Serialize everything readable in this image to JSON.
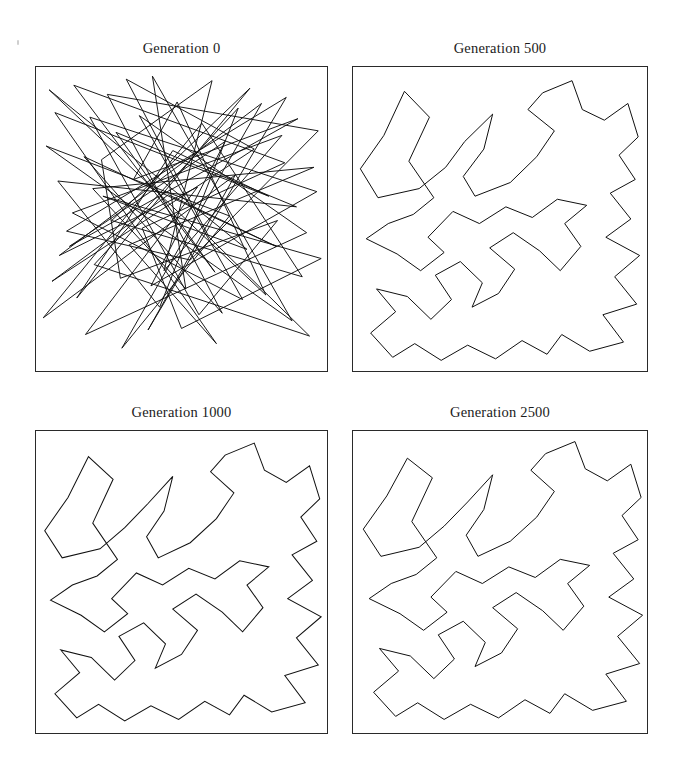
{
  "figure": {
    "kind": "tsp-evolution-grid",
    "rows": 2,
    "cols": 2,
    "background": "#ffffff",
    "line_color": "#101010",
    "frame_color": "#2a2a2a"
  },
  "panels": [
    {
      "title": "Generation 0",
      "index": 0,
      "generation": 0,
      "frame": {
        "x": 35,
        "y": 66,
        "w": 293,
        "h": 306
      }
    },
    {
      "title": "Generation 500",
      "index": 1,
      "generation": 500,
      "frame": {
        "x": 352,
        "y": 66,
        "w": 296,
        "h": 306
      }
    },
    {
      "title": "Generation 1000",
      "index": 2,
      "generation": 1000,
      "frame": {
        "x": 35,
        "y": 430,
        "w": 293,
        "h": 304
      }
    },
    {
      "title": "Generation 2500",
      "index": 3,
      "generation": 2500,
      "frame": {
        "x": 352,
        "y": 430,
        "w": 296,
        "h": 304
      }
    }
  ],
  "chart_data": {
    "type": "line",
    "subtitle": "Closed tour through a fixed set of cities, drawn at four generations",
    "xlabel": "",
    "ylabel": "",
    "xlim": [
      0,
      100
    ],
    "ylim": [
      0,
      100
    ],
    "grid": false,
    "legend": false,
    "axis_ticks": false,
    "panel_titles": [
      "Generation 0",
      "Generation 500",
      "Generation 1000",
      "Generation 2500"
    ],
    "series": [
      {
        "name": "Generation 0",
        "closed": true,
        "n_points": 74,
        "description": "Random initial tour, heavily self-crossing",
        "points": [
          [
            22.5,
            69.5
          ],
          [
            60.5,
            95.5
          ],
          [
            44.0,
            33.0
          ],
          [
            84.5,
            77.5
          ],
          [
            12.5,
            52.0
          ],
          [
            71.0,
            23.5
          ],
          [
            35.5,
            84.0
          ],
          [
            93.0,
            45.5
          ],
          [
            17.0,
            12.0
          ],
          [
            55.5,
            60.5
          ],
          [
            8.0,
            38.0
          ],
          [
            77.5,
            88.0
          ],
          [
            29.5,
            7.5
          ],
          [
            66.5,
            51.0
          ],
          [
            3.5,
            74.0
          ],
          [
            88.0,
            16.5
          ],
          [
            40.0,
            97.0
          ],
          [
            51.5,
            27.0
          ],
          [
            19.5,
            60.0
          ],
          [
            95.5,
            67.0
          ],
          [
            32.0,
            41.5
          ],
          [
            62.0,
            9.0
          ],
          [
            6.5,
            85.0
          ],
          [
            80.0,
            57.5
          ],
          [
            47.0,
            72.5
          ],
          [
            14.0,
            24.0
          ],
          [
            73.5,
            93.0
          ],
          [
            26.0,
            49.5
          ],
          [
            91.5,
            31.0
          ],
          [
            57.0,
            81.5
          ],
          [
            2.5,
            17.5
          ],
          [
            68.5,
            64.5
          ],
          [
            38.5,
            13.5
          ],
          [
            86.0,
            90.0
          ],
          [
            10.5,
            46.0
          ],
          [
            53.0,
            36.5
          ],
          [
            97.0,
            79.0
          ],
          [
            24.5,
            91.0
          ],
          [
            64.0,
            19.0
          ],
          [
            16.5,
            70.5
          ],
          [
            82.5,
            41.0
          ],
          [
            45.5,
            58.0
          ],
          [
            5.5,
            29.5
          ],
          [
            75.0,
            73.0
          ],
          [
            31.0,
            96.0
          ],
          [
            59.5,
            44.0
          ],
          [
            94.0,
            11.5
          ],
          [
            20.0,
            35.0
          ],
          [
            69.5,
            86.5
          ],
          [
            42.5,
            21.0
          ],
          [
            7.5,
            62.5
          ],
          [
            89.5,
            54.0
          ],
          [
            27.5,
            78.5
          ],
          [
            61.5,
            32.5
          ],
          [
            13.0,
            94.0
          ],
          [
            85.5,
            68.5
          ],
          [
            36.5,
            47.0
          ],
          [
            50.0,
            14.0
          ],
          [
            98.0,
            37.0
          ],
          [
            23.0,
            57.5
          ],
          [
            72.5,
            40.0
          ],
          [
            4.5,
            92.5
          ],
          [
            79.0,
            25.0
          ],
          [
            48.5,
            88.5
          ],
          [
            33.5,
            63.0
          ],
          [
            90.0,
            83.0
          ],
          [
            11.5,
            41.0
          ],
          [
            65.0,
            75.5
          ],
          [
            39.5,
            28.0
          ],
          [
            96.5,
            59.0
          ],
          [
            18.5,
            83.5
          ],
          [
            56.0,
            18.5
          ],
          [
            83.0,
            49.5
          ],
          [
            29.0,
            30.5
          ]
        ]
      },
      {
        "name": "Generation 500",
        "closed": true,
        "n_points": 74,
        "description": "Partly optimised tour, a few crossings remain near lower-left",
        "points": [
          [
            17.5,
            92.0
          ],
          [
            10.5,
            77.5
          ],
          [
            2.5,
            66.5
          ],
          [
            8.5,
            57.0
          ],
          [
            22.5,
            60.0
          ],
          [
            31.5,
            67.0
          ],
          [
            38.0,
            75.5
          ],
          [
            47.5,
            84.5
          ],
          [
            44.5,
            73.0
          ],
          [
            37.5,
            64.0
          ],
          [
            41.5,
            57.5
          ],
          [
            53.5,
            62.0
          ],
          [
            62.5,
            70.5
          ],
          [
            68.5,
            79.0
          ],
          [
            59.5,
            86.0
          ],
          [
            64.5,
            91.5
          ],
          [
            74.5,
            95.5
          ],
          [
            78.0,
            86.0
          ],
          [
            85.5,
            82.5
          ],
          [
            93.5,
            88.0
          ],
          [
            97.0,
            77.0
          ],
          [
            90.5,
            71.0
          ],
          [
            96.0,
            63.0
          ],
          [
            87.5,
            58.5
          ],
          [
            94.5,
            50.0
          ],
          [
            86.0,
            44.0
          ],
          [
            97.5,
            38.0
          ],
          [
            89.0,
            31.0
          ],
          [
            96.5,
            22.0
          ],
          [
            85.0,
            18.5
          ],
          [
            92.0,
            9.5
          ],
          [
            80.5,
            6.5
          ],
          [
            71.0,
            12.0
          ],
          [
            66.0,
            5.5
          ],
          [
            57.5,
            10.0
          ],
          [
            48.5,
            4.0
          ],
          [
            39.0,
            8.5
          ],
          [
            30.0,
            3.5
          ],
          [
            21.0,
            9.0
          ],
          [
            13.5,
            4.5
          ],
          [
            6.0,
            12.5
          ],
          [
            14.5,
            19.5
          ],
          [
            8.0,
            27.0
          ],
          [
            18.5,
            24.5
          ],
          [
            26.5,
            17.0
          ],
          [
            33.5,
            23.5
          ],
          [
            28.0,
            31.5
          ],
          [
            36.5,
            36.0
          ],
          [
            44.0,
            29.0
          ],
          [
            40.5,
            21.0
          ],
          [
            49.5,
            25.5
          ],
          [
            55.0,
            33.5
          ],
          [
            46.5,
            40.5
          ],
          [
            54.5,
            45.5
          ],
          [
            63.5,
            39.5
          ],
          [
            70.5,
            33.0
          ],
          [
            77.5,
            41.0
          ],
          [
            72.0,
            48.5
          ],
          [
            79.5,
            54.5
          ],
          [
            69.5,
            56.5
          ],
          [
            61.0,
            50.5
          ],
          [
            52.0,
            54.0
          ],
          [
            43.0,
            48.5
          ],
          [
            34.0,
            52.5
          ],
          [
            25.5,
            44.0
          ],
          [
            31.0,
            39.0
          ],
          [
            23.0,
            33.0
          ],
          [
            15.0,
            38.5
          ],
          [
            4.5,
            43.5
          ],
          [
            12.0,
            48.5
          ],
          [
            20.5,
            51.5
          ],
          [
            27.5,
            57.0
          ],
          [
            19.0,
            69.0
          ],
          [
            26.0,
            83.5
          ]
        ]
      },
      {
        "name": "Generation 1000",
        "closed": true,
        "n_points": 74,
        "description": "Near-optimal tour, almost no crossings, small tangle lower-left",
        "points": [
          [
            18.0,
            91.5
          ],
          [
            11.0,
            78.0
          ],
          [
            3.0,
            67.0
          ],
          [
            9.0,
            58.0
          ],
          [
            22.0,
            61.0
          ],
          [
            30.5,
            68.0
          ],
          [
            38.5,
            76.0
          ],
          [
            47.0,
            85.0
          ],
          [
            44.0,
            73.5
          ],
          [
            38.0,
            65.0
          ],
          [
            42.0,
            58.0
          ],
          [
            53.0,
            63.0
          ],
          [
            62.0,
            71.0
          ],
          [
            68.0,
            79.5
          ],
          [
            60.0,
            86.5
          ],
          [
            65.0,
            92.0
          ],
          [
            75.0,
            96.0
          ],
          [
            78.5,
            87.0
          ],
          [
            86.0,
            83.0
          ],
          [
            94.0,
            88.5
          ],
          [
            97.5,
            77.5
          ],
          [
            91.0,
            71.5
          ],
          [
            96.5,
            63.5
          ],
          [
            88.0,
            59.0
          ],
          [
            95.0,
            50.5
          ],
          [
            86.5,
            44.5
          ],
          [
            98.0,
            38.5
          ],
          [
            89.5,
            31.5
          ],
          [
            97.0,
            22.5
          ],
          [
            85.5,
            19.0
          ],
          [
            92.5,
            10.0
          ],
          [
            81.0,
            7.0
          ],
          [
            71.5,
            12.5
          ],
          [
            66.5,
            6.0
          ],
          [
            58.0,
            10.5
          ],
          [
            49.0,
            4.5
          ],
          [
            39.5,
            9.0
          ],
          [
            30.5,
            4.0
          ],
          [
            21.5,
            9.5
          ],
          [
            14.0,
            5.0
          ],
          [
            6.5,
            13.0
          ],
          [
            15.0,
            20.0
          ],
          [
            8.5,
            27.5
          ],
          [
            19.0,
            25.0
          ],
          [
            27.0,
            17.5
          ],
          [
            34.0,
            24.0
          ],
          [
            28.5,
            32.0
          ],
          [
            37.0,
            36.5
          ],
          [
            44.5,
            29.5
          ],
          [
            41.0,
            21.5
          ],
          [
            50.0,
            26.0
          ],
          [
            55.5,
            34.0
          ],
          [
            47.0,
            41.0
          ],
          [
            55.0,
            46.0
          ],
          [
            64.0,
            40.0
          ],
          [
            71.0,
            33.5
          ],
          [
            78.0,
            41.5
          ],
          [
            72.5,
            49.0
          ],
          [
            80.0,
            55.0
          ],
          [
            70.0,
            57.0
          ],
          [
            61.5,
            51.0
          ],
          [
            52.5,
            54.5
          ],
          [
            43.5,
            49.0
          ],
          [
            34.5,
            53.0
          ],
          [
            26.0,
            44.5
          ],
          [
            31.5,
            39.5
          ],
          [
            23.5,
            33.5
          ],
          [
            15.5,
            39.0
          ],
          [
            5.0,
            44.0
          ],
          [
            12.5,
            49.0
          ],
          [
            21.0,
            52.0
          ],
          [
            28.0,
            57.5
          ],
          [
            19.5,
            69.5
          ],
          [
            26.5,
            84.0
          ]
        ]
      },
      {
        "name": "Generation 2500",
        "closed": true,
        "n_points": 74,
        "description": "Converged tour, no self-intersections",
        "points": [
          [
            18.5,
            91.0
          ],
          [
            11.5,
            78.5
          ],
          [
            3.5,
            67.5
          ],
          [
            9.5,
            58.5
          ],
          [
            22.5,
            61.5
          ],
          [
            31.0,
            68.5
          ],
          [
            39.0,
            76.5
          ],
          [
            47.5,
            85.5
          ],
          [
            44.5,
            74.0
          ],
          [
            38.5,
            65.5
          ],
          [
            42.5,
            58.5
          ],
          [
            53.5,
            63.5
          ],
          [
            62.5,
            71.5
          ],
          [
            68.5,
            80.0
          ],
          [
            60.5,
            87.0
          ],
          [
            65.5,
            92.5
          ],
          [
            75.5,
            96.5
          ],
          [
            79.0,
            87.5
          ],
          [
            86.5,
            83.5
          ],
          [
            94.5,
            89.0
          ],
          [
            98.0,
            78.0
          ],
          [
            91.5,
            72.0
          ],
          [
            97.0,
            64.0
          ],
          [
            88.5,
            59.5
          ],
          [
            95.5,
            51.0
          ],
          [
            87.0,
            45.0
          ],
          [
            98.5,
            39.0
          ],
          [
            90.0,
            32.0
          ],
          [
            97.5,
            23.0
          ],
          [
            86.0,
            19.5
          ],
          [
            93.0,
            10.5
          ],
          [
            81.5,
            7.5
          ],
          [
            72.0,
            13.0
          ],
          [
            67.0,
            6.5
          ],
          [
            58.5,
            11.0
          ],
          [
            49.5,
            5.0
          ],
          [
            40.0,
            9.5
          ],
          [
            31.0,
            4.5
          ],
          [
            22.0,
            10.0
          ],
          [
            14.5,
            5.5
          ],
          [
            7.0,
            13.5
          ],
          [
            15.5,
            20.5
          ],
          [
            9.0,
            28.0
          ],
          [
            19.5,
            25.5
          ],
          [
            27.5,
            18.0
          ],
          [
            34.5,
            24.5
          ],
          [
            29.0,
            32.5
          ],
          [
            37.5,
            37.0
          ],
          [
            45.0,
            30.0
          ],
          [
            41.5,
            22.0
          ],
          [
            50.5,
            26.5
          ],
          [
            56.0,
            34.5
          ],
          [
            47.5,
            41.5
          ],
          [
            55.5,
            46.5
          ],
          [
            64.5,
            40.5
          ],
          [
            71.5,
            34.0
          ],
          [
            78.5,
            42.0
          ],
          [
            73.0,
            49.5
          ],
          [
            80.5,
            55.5
          ],
          [
            70.5,
            57.5
          ],
          [
            62.0,
            51.5
          ],
          [
            53.0,
            55.0
          ],
          [
            44.0,
            49.5
          ],
          [
            35.0,
            53.5
          ],
          [
            26.5,
            45.0
          ],
          [
            32.0,
            40.0
          ],
          [
            24.0,
            34.0
          ],
          [
            16.0,
            39.5
          ],
          [
            5.5,
            44.5
          ],
          [
            13.0,
            49.5
          ],
          [
            21.5,
            52.5
          ],
          [
            28.5,
            58.0
          ],
          [
            20.0,
            70.0
          ],
          [
            27.0,
            84.5
          ]
        ]
      }
    ]
  }
}
